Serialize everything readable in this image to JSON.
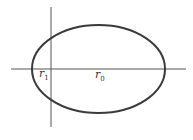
{
  "diagram": {
    "type": "ellipse-with-axes",
    "colors": {
      "background": "#ffffff",
      "axes": "#555555",
      "ellipse": "#3a3a3a",
      "text": "#333333"
    },
    "axes": {
      "vertical": {
        "x": 51,
        "y1": 7,
        "y2": 127
      },
      "horizontal": {
        "y": 69,
        "x1": 11,
        "x2": 186
      }
    },
    "ellipse": {
      "cx": 98.5,
      "cy": 69,
      "rx": 66.5,
      "ry": 44
    },
    "labels": [
      {
        "name": "r1",
        "base": "r",
        "subscript": "1",
        "x": 39,
        "y": 77
      },
      {
        "name": "r0",
        "base": "r",
        "subscript": "0",
        "x": 95,
        "y": 78
      }
    ]
  }
}
